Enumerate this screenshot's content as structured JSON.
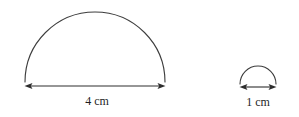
{
  "figure": {
    "background_color": "#ffffff",
    "stroke_color": "#3d3d3d",
    "label_color": "#1f1f1f",
    "shapes": [
      {
        "id": "large-semicircle",
        "kind": "semicircle-arc",
        "label": "4 cm",
        "label_value": "4",
        "label_unit": "cm",
        "diameter_px": 140,
        "radius_px": 70,
        "center_x": 95,
        "baseline_y": 82,
        "apex_y": 7,
        "arc_start_x": 25,
        "arc_end_x": 165,
        "dim_line_y": 86,
        "dim_start_x": 25,
        "dim_end_x": 165,
        "label_x": 97,
        "label_baseline_y": 105
      },
      {
        "id": "small-semicircle",
        "kind": "semicircle-arc",
        "label": "1 cm",
        "label_value": "1",
        "label_unit": "cm",
        "diameter_px": 36,
        "radius_px": 18,
        "center_x": 258,
        "baseline_y": 84,
        "apex_y": 62,
        "arc_start_x": 240,
        "arc_end_x": 276,
        "dim_line_y": 87,
        "dim_start_x": 240,
        "dim_end_x": 276,
        "label_x": 258,
        "label_baseline_y": 106
      }
    ]
  }
}
